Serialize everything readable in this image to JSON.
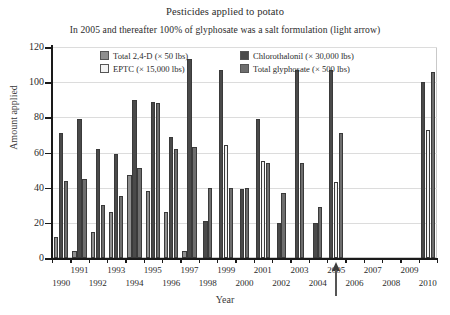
{
  "chart_data": {
    "type": "bar",
    "title": "Pesticides applied to potato",
    "subtitle": "In 2005 and thereafter 100% of glyphosate was a salt formulation (light arrow)",
    "xlabel": "Year",
    "ylabel": "Amount applied",
    "ylim": [
      0,
      120
    ],
    "yticks": [
      0,
      20,
      40,
      60,
      80,
      100,
      120
    ],
    "grid": "horizontal",
    "legend_position": "top-center-inside",
    "categories": [
      "1990",
      "1991",
      "1992",
      "1993",
      "1994",
      "1995",
      "1996",
      "1997",
      "1998",
      "1999",
      "2000",
      "2001",
      "2002",
      "2003",
      "2004",
      "2005",
      "2006",
      "2007",
      "2008",
      "2009",
      "2010"
    ],
    "series": [
      {
        "name": "Total 2,4-D (× 50 lbs)",
        "color": "#8f8f8f",
        "values": [
          12,
          null,
          4,
          null,
          15,
          null,
          26,
          47,
          51,
          4,
          null,
          null,
          null,
          null,
          null,
          null,
          null,
          null,
          null,
          null,
          null
        ]
      },
      {
        "name": "Chlorothalonil (× 30,000 lbs)",
        "color": "#4a4a4a",
        "values": [
          71,
          79,
          62,
          59,
          69,
          90,
          89,
          88,
          69,
          113,
          21,
          107,
          79,
          39,
          79,
          107,
          71,
          null,
          null,
          null,
          100
        ]
      },
      {
        "name": "EPTC (× 15,000 lbs)",
        "color": "#f2f2f2",
        "values": [
          null,
          null,
          null,
          null,
          null,
          null,
          null,
          null,
          null,
          64,
          null,
          72,
          null,
          null,
          null,
          null,
          null,
          null,
          null,
          null,
          null
        ]
      },
      {
        "name": "Total glyphosate (× 500 lbs)",
        "color": "#6e6e6e",
        "values": [
          44,
          45,
          30,
          26,
          35,
          51,
          38,
          62,
          63,
          40,
          40,
          55,
          54,
          20,
          37,
          71,
          null,
          null,
          null,
          null,
          73
        ]
      }
    ],
    "bar_groups": [
      {
        "year": "1990",
        "bars": [
          {
            "series": 0,
            "value": 12
          },
          {
            "series": 1,
            "value": 71
          },
          {
            "series": 3,
            "value": 44
          }
        ]
      },
      {
        "year": "1991",
        "bars": [
          {
            "series": 0,
            "value": 4
          },
          {
            "series": 1,
            "value": 79
          },
          {
            "series": 3,
            "value": 45
          }
        ]
      },
      {
        "year": "1992",
        "bars": [
          {
            "series": 0,
            "value": 15
          },
          {
            "series": 1,
            "value": 62
          },
          {
            "series": 3,
            "value": 30
          }
        ]
      },
      {
        "year": "1993",
        "bars": [
          {
            "series": 0,
            "value": 26
          },
          {
            "series": 1,
            "value": 59
          },
          {
            "series": 3,
            "value": 35
          }
        ]
      },
      {
        "year": "1994",
        "bars": [
          {
            "series": 0,
            "value": 47
          },
          {
            "series": 1,
            "value": 90
          },
          {
            "series": 3,
            "value": 51
          }
        ]
      },
      {
        "year": "1995",
        "bars": [
          {
            "series": 0,
            "value": 38
          },
          {
            "series": 1,
            "value": 89
          },
          {
            "series": 3,
            "value": 88
          }
        ]
      },
      {
        "year": "1996",
        "bars": [
          {
            "series": 0,
            "value": 26
          },
          {
            "series": 1,
            "value": 69
          },
          {
            "series": 3,
            "value": 62
          }
        ]
      },
      {
        "year": "1997",
        "bars": [
          {
            "series": 0,
            "value": 4
          },
          {
            "series": 1,
            "value": 113
          },
          {
            "series": 3,
            "value": 63
          }
        ]
      },
      {
        "year": "1998",
        "bars": [
          {
            "series": 1,
            "value": 21
          },
          {
            "series": 3,
            "value": 40
          }
        ]
      },
      {
        "year": "1999",
        "bars": [
          {
            "series": 1,
            "value": 107
          },
          {
            "series": 2,
            "value": 64
          },
          {
            "series": 3,
            "value": 40
          }
        ]
      },
      {
        "year": "2000",
        "bars": [
          {
            "series": 1,
            "value": 39
          },
          {
            "series": 3,
            "value": 40
          }
        ]
      },
      {
        "year": "2001",
        "bars": [
          {
            "series": 1,
            "value": 79
          },
          {
            "series": 2,
            "value": 55
          },
          {
            "series": 3,
            "value": 54
          }
        ]
      },
      {
        "year": "2002",
        "bars": [
          {
            "series": 1,
            "value": 20
          },
          {
            "series": 3,
            "value": 37
          }
        ]
      },
      {
        "year": "2003",
        "bars": [
          {
            "series": 1,
            "value": 107
          },
          {
            "series": 3,
            "value": 54
          }
        ]
      },
      {
        "year": "2004",
        "bars": [
          {
            "series": 1,
            "value": 20
          },
          {
            "series": 3,
            "value": 29
          }
        ]
      },
      {
        "year": "2005",
        "bars": [
          {
            "series": 1,
            "value": 107
          },
          {
            "series": 2,
            "value": 43
          },
          {
            "series": 3,
            "value": 71
          }
        ]
      },
      {
        "year": "2010",
        "bars": [
          {
            "series": 1,
            "value": 100
          },
          {
            "series": 2,
            "value": 73
          },
          {
            "series": 3,
            "value": 106
          }
        ]
      }
    ],
    "annotations": [
      {
        "name": "light-arrow",
        "points_to_year": "2005",
        "direction": "up",
        "color": "#3c3c3c"
      }
    ]
  },
  "legend": {
    "items": [
      {
        "label": "Total 2,4-D (× 50 lbs)",
        "color": "#8f8f8f"
      },
      {
        "label": "Chlorothalonil (× 30,000 lbs)",
        "color": "#4a4a4a"
      },
      {
        "label": "EPTC (× 15,000 lbs)",
        "color": "#f2f2f2"
      },
      {
        "label": "Total glyphosate (× 500 lbs)",
        "color": "#6e6e6e"
      }
    ]
  }
}
